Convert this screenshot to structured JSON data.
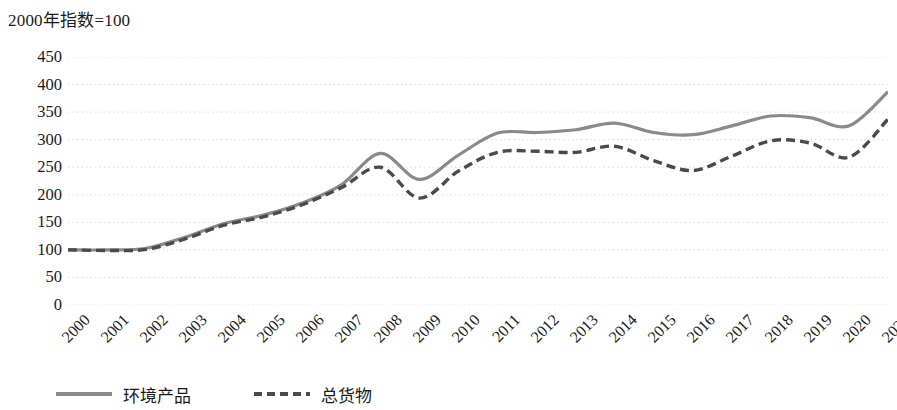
{
  "chart_data": {
    "type": "line",
    "title": "2000年指数=100",
    "xlabel": "",
    "ylabel": "",
    "ylim": [
      0,
      450
    ],
    "ytick_step": 50,
    "yticks": [
      "450",
      "400",
      "350",
      "300",
      "250",
      "200",
      "150",
      "100",
      "50",
      "0"
    ],
    "grid": true,
    "grid_style": "dotted",
    "legend_position": "bottom-left",
    "categories": [
      "2000",
      "2001",
      "2002",
      "2003",
      "2004",
      "2005",
      "2006",
      "2007",
      "2008",
      "2009",
      "2010",
      "2011",
      "2012",
      "2013",
      "2014",
      "2015",
      "2016",
      "2017",
      "2018",
      "2019",
      "2020",
      "2021"
    ],
    "series": [
      {
        "name": "环境产品",
        "style": "solid",
        "color": "#8a8a8a",
        "values": [
          100,
          100,
          103,
          123,
          148,
          163,
          185,
          218,
          275,
          228,
          272,
          312,
          313,
          318,
          330,
          313,
          309,
          325,
          343,
          340,
          325,
          387
        ]
      },
      {
        "name": "总货物",
        "style": "dashed",
        "color": "#4a4a4a",
        "values": [
          100,
          99,
          101,
          120,
          145,
          160,
          182,
          213,
          250,
          194,
          243,
          277,
          279,
          277,
          288,
          262,
          244,
          270,
          298,
          294,
          268,
          337
        ]
      }
    ]
  },
  "legend": {
    "items": [
      {
        "label": "环境产品"
      },
      {
        "label": "总货物"
      }
    ]
  }
}
